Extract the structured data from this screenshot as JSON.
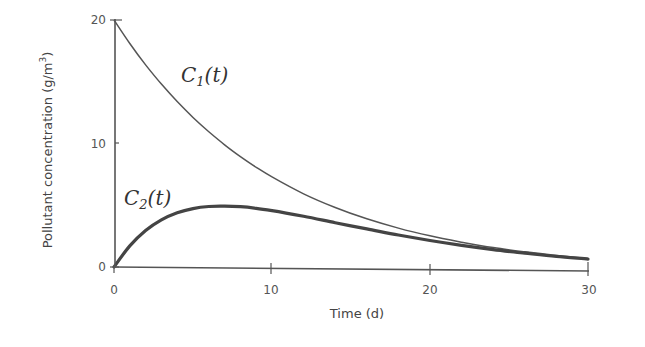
{
  "chart_data": {
    "type": "line",
    "title": "",
    "xlabel": "Time (d)",
    "ylabel": "Pollutant concentration (g/m³)",
    "ylabel_base": "Pollutant concentration (g/m",
    "ylabel_sup": "3",
    "ylabel_close": ")",
    "xlim": [
      0,
      30
    ],
    "ylim": [
      0,
      20
    ],
    "x_ticks": [
      0,
      10,
      20,
      30
    ],
    "y_ticks": [
      0,
      10,
      20
    ],
    "grid": false,
    "legend": "none (inline curve labels)",
    "x": [
      0,
      1,
      2,
      3,
      4,
      5,
      6,
      7,
      8,
      9,
      10,
      12,
      14,
      16,
      18,
      20,
      22,
      24,
      26,
      28,
      30
    ],
    "series": [
      {
        "name": "C1(t)",
        "label_main": "C",
        "label_sub": "1",
        "label_rest": "(t)",
        "stroke_width": 1.5,
        "values": [
          20.0,
          18.1,
          16.37,
          14.82,
          13.41,
          12.13,
          10.98,
          9.93,
          8.99,
          8.13,
          7.36,
          6.02,
          4.93,
          4.04,
          3.31,
          2.71,
          2.22,
          1.81,
          1.49,
          1.22,
          1.0
        ]
      },
      {
        "name": "C2(t)",
        "label_main": "C",
        "label_sub": "2",
        "label_rest": "(t)",
        "stroke_width": 3.2,
        "values": [
          0.0,
          1.72,
          2.97,
          3.84,
          4.42,
          4.77,
          4.95,
          4.99,
          4.95,
          4.83,
          4.65,
          4.21,
          3.71,
          3.23,
          2.76,
          2.34,
          1.97,
          1.65,
          1.38,
          1.14,
          0.95
        ]
      }
    ],
    "colors": {
      "axis": "#555555",
      "curve": "#4a4a4a",
      "text": "#444444"
    }
  }
}
